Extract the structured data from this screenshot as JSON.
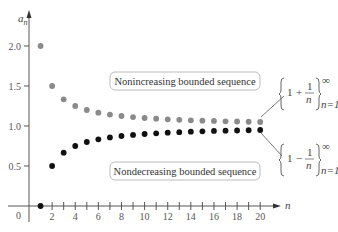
{
  "chart_data": {
    "type": "scatter",
    "title": "",
    "xlabel": "n",
    "ylabel": "a_n",
    "xlim": [
      0,
      21
    ],
    "ylim": [
      0,
      2.2
    ],
    "x_ticks": [
      2,
      4,
      6,
      8,
      10,
      12,
      14,
      16,
      18,
      20
    ],
    "y_ticks": [
      0.5,
      1.0,
      1.5,
      2.0
    ],
    "grid": false,
    "series": [
      {
        "name": "{1 + 1/n} n=1 to ∞",
        "color": "#8a8a8a",
        "label": "Nonincreasing bounded sequence",
        "x": [
          1,
          2,
          3,
          4,
          5,
          6,
          7,
          8,
          9,
          10,
          11,
          12,
          13,
          14,
          15,
          16,
          17,
          18,
          19,
          20
        ],
        "values": [
          2.0,
          1.5,
          1.333,
          1.25,
          1.2,
          1.167,
          1.143,
          1.125,
          1.111,
          1.1,
          1.091,
          1.083,
          1.077,
          1.071,
          1.067,
          1.063,
          1.059,
          1.056,
          1.053,
          1.05
        ]
      },
      {
        "name": "{1 - 1/n} n=1 to ∞",
        "color": "#111111",
        "label": "Nondecreasing bounded sequence",
        "x": [
          1,
          2,
          3,
          4,
          5,
          6,
          7,
          8,
          9,
          10,
          11,
          12,
          13,
          14,
          15,
          16,
          17,
          18,
          19,
          20
        ],
        "values": [
          0.0,
          0.5,
          0.667,
          0.75,
          0.8,
          0.833,
          0.857,
          0.875,
          0.889,
          0.9,
          0.909,
          0.917,
          0.923,
          0.929,
          0.933,
          0.938,
          0.941,
          0.944,
          0.947,
          0.95
        ]
      }
    ]
  },
  "labels": {
    "y_axis": "a",
    "y_axis_sub": "n",
    "x_axis": "n",
    "origin": "0",
    "y_ticks": [
      "2.0",
      "1.5",
      "1.0",
      "0.5"
    ],
    "x_ticks": [
      "2",
      "4",
      "6",
      "8",
      "10",
      "12",
      "14",
      "16",
      "18",
      "20"
    ],
    "box_top": "Nonincreasing bounded sequence",
    "box_bottom": "Nondecreasing bounded sequence",
    "formula_top": {
      "one": "1",
      "op": "+",
      "num": "1",
      "den": "n",
      "sup": "∞",
      "sub": "n=1"
    },
    "formula_bottom": {
      "one": "1",
      "op": "−",
      "num": "1",
      "den": "n",
      "sup": "∞",
      "sub": "n=1"
    }
  }
}
